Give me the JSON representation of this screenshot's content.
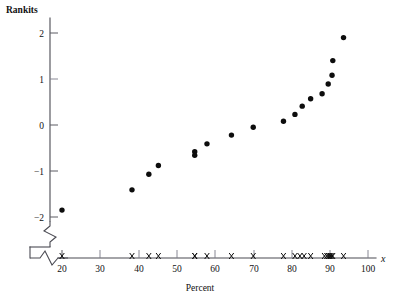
{
  "chart_data": {
    "type": "scatter",
    "title": "",
    "xlabel": "Percent",
    "ylabel": "Rankits",
    "x_axis_variable_label": "x",
    "xlim": [
      15,
      104
    ],
    "ylim": [
      -2.35,
      2.3
    ],
    "x_ticks": [
      20,
      30,
      40,
      50,
      60,
      70,
      80,
      90,
      100
    ],
    "x_tick_labels": [
      "20",
      "30",
      "40",
      "50",
      "60",
      "70",
      "80",
      "90",
      "100"
    ],
    "y_ticks": [
      -2,
      -1,
      0,
      1,
      2
    ],
    "y_tick_labels": [
      "−2",
      "−1",
      "0",
      "1",
      "2"
    ],
    "grid": false,
    "legend": "none",
    "x_axis_break": true,
    "y_axis_break": true,
    "series": [
      {
        "name": "Rankit plot",
        "marker": "filled-circle",
        "color": "#0d0d0d",
        "points": [
          {
            "x": 20.0,
            "y": -1.85
          },
          {
            "x": 38.3,
            "y": -1.41
          },
          {
            "x": 42.7,
            "y": -1.07
          },
          {
            "x": 45.2,
            "y": -0.88
          },
          {
            "x": 54.7,
            "y": -0.58
          },
          {
            "x": 54.7,
            "y": -0.66
          },
          {
            "x": 57.9,
            "y": -0.41
          },
          {
            "x": 64.3,
            "y": -0.22
          },
          {
            "x": 70.0,
            "y": -0.05
          },
          {
            "x": 77.9,
            "y": 0.08
          },
          {
            "x": 80.9,
            "y": 0.23
          },
          {
            "x": 82.8,
            "y": 0.41
          },
          {
            "x": 85.0,
            "y": 0.57
          },
          {
            "x": 88.0,
            "y": 0.68
          },
          {
            "x": 89.6,
            "y": 0.89
          },
          {
            "x": 90.6,
            "y": 1.08
          },
          {
            "x": 90.8,
            "y": 1.4
          },
          {
            "x": 93.6,
            "y": 1.9
          }
        ]
      }
    ],
    "rug": {
      "name": "Percent rug marks",
      "marker": "x",
      "color": "#0d0d0d",
      "values": [
        20.0,
        38.3,
        42.7,
        45.2,
        54.7,
        54.7,
        57.9,
        64.3,
        70.0,
        77.9,
        80.9,
        82.2,
        83.3,
        85.0,
        88.6,
        89.2,
        89.6,
        90.0,
        90.3,
        90.6,
        90.8,
        93.6
      ]
    }
  },
  "colors": {
    "marker": "#0d0d0d",
    "axis": "#4a4a52",
    "background": "#ffffff",
    "text": "#111111"
  },
  "labels": {
    "y_axis_title": "Rankits",
    "x_axis_title": "Percent",
    "x_variable": "x"
  }
}
